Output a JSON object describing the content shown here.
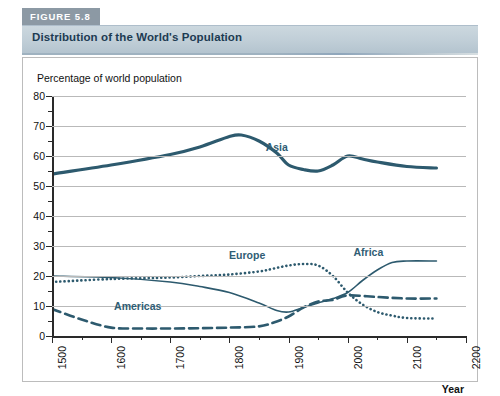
{
  "figure": {
    "badge": "FIGURE 5.8",
    "title": "Distribution of the World's Population"
  },
  "colors": {
    "line": "#2d5a6e",
    "badge_bg": "#8c99a4",
    "title_bg": "#c3d0d8",
    "title_text": "#1d3b52",
    "grid": "#b9b9b9",
    "axis": "#2a2a2a",
    "label_text": "#2f5d74"
  },
  "chart_data": {
    "type": "line",
    "title": "Distribution of the World's Population",
    "xlabel": "Year",
    "ylabel": "Percentage of world population",
    "xlim": [
      1500,
      2200
    ],
    "ylim": [
      0,
      80
    ],
    "xticks": [
      1500,
      1600,
      1700,
      1800,
      1900,
      2000,
      2100,
      2200
    ],
    "yticks": [
      0,
      10,
      20,
      30,
      40,
      50,
      60,
      70,
      80
    ],
    "yticks_minor": [
      5,
      15,
      25,
      35,
      45,
      55,
      65,
      75
    ],
    "grid": "horizontal",
    "legend": "inline-annotations",
    "series": [
      {
        "name": "Asia",
        "style": "solid-thick",
        "label_x": 1880,
        "label_y": 63,
        "x": [
          1500,
          1600,
          1700,
          1750,
          1800,
          1820,
          1850,
          1880,
          1900,
          1925,
          1950,
          1975,
          2000,
          2025,
          2050,
          2100,
          2150
        ],
        "y": [
          54,
          57,
          60.5,
          63,
          66.5,
          67,
          65,
          61,
          57,
          55.5,
          55,
          57,
          60,
          59,
          58,
          56.5,
          56
        ]
      },
      {
        "name": "Europe",
        "style": "dotted",
        "label_x": 1830,
        "label_y": 27,
        "x": [
          1500,
          1600,
          1700,
          1750,
          1800,
          1850,
          1875,
          1900,
          1925,
          1950,
          1975,
          2000,
          2025,
          2050,
          2075,
          2100,
          2150
        ],
        "y": [
          18,
          19,
          19.5,
          20,
          20.5,
          21.5,
          22.5,
          23.5,
          24,
          23.5,
          20,
          14.5,
          10.5,
          8,
          6.8,
          6,
          5.8
        ]
      },
      {
        "name": "Africa",
        "style": "solid-thin",
        "label_x": 2035,
        "label_y": 28,
        "x": [
          1500,
          1600,
          1700,
          1750,
          1800,
          1850,
          1880,
          1900,
          1925,
          1950,
          1975,
          2000,
          2025,
          2050,
          2075,
          2100,
          2150
        ],
        "y": [
          20,
          19.5,
          18,
          16.5,
          14.5,
          11,
          8.5,
          8,
          9.5,
          11,
          12.5,
          14.5,
          18.5,
          22,
          24.5,
          25,
          25
        ]
      },
      {
        "name": "Americas",
        "style": "dashed",
        "label_x": 1645,
        "label_y": 10,
        "x": [
          1500,
          1550,
          1600,
          1650,
          1700,
          1750,
          1800,
          1850,
          1875,
          1900,
          1925,
          1950,
          1975,
          2000,
          2050,
          2100,
          2150
        ],
        "y": [
          9,
          5.5,
          2.8,
          2.5,
          2.5,
          2.6,
          2.8,
          3.2,
          4.5,
          6.5,
          9.5,
          11.5,
          12,
          13.5,
          13,
          12.5,
          12.5
        ]
      }
    ]
  }
}
